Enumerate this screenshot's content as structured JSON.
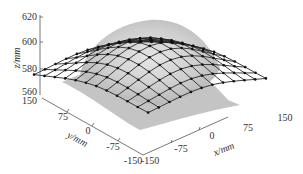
{
  "chart_data": {
    "type": "surface3d",
    "title": "",
    "xlabel": "x/mm",
    "ylabel": "y/mm",
    "zlabel": "z/mm",
    "x_ticks": [
      "-150",
      "-75",
      "0",
      "75",
      "150"
    ],
    "y_ticks": [
      "150",
      "75",
      "0",
      "-75",
      "-150"
    ],
    "z_ticks": [
      "560",
      "580",
      "600",
      "620"
    ],
    "xlim": [
      -150,
      150
    ],
    "ylim": [
      -150,
      150
    ],
    "zlim": [
      560,
      620
    ],
    "grid": false,
    "legend": null,
    "surface": {
      "peak_z": 618,
      "base_z": 572,
      "center": [
        0,
        0
      ],
      "color": "#bdbdbd"
    },
    "mesh": {
      "node_color": "#1a1a1a",
      "line_color": "#333333",
      "rows": 12,
      "cols": 12
    }
  }
}
